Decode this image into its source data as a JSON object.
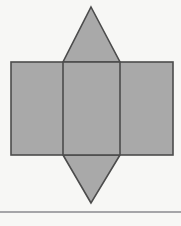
{
  "figure": {
    "title": "Geometric net diagram",
    "canvas": {
      "width": 181,
      "height": 226,
      "background_color": "#f7f7f5"
    },
    "style": {
      "fill_color": "#a9a9a9",
      "stroke_color": "#4c4c4c",
      "stroke_width": 1.6,
      "rule_color": "#8a8a8e"
    },
    "shapes": [
      {
        "id": "top-triangle",
        "name": "top-triangle",
        "type": "triangle",
        "points": "91,7 120,62 63,62",
        "vertices": [
          {
            "x": 91,
            "y": 7
          },
          {
            "x": 120,
            "y": 62
          },
          {
            "x": 63,
            "y": 62
          }
        ]
      },
      {
        "id": "bottom-triangle",
        "name": "bottom-triangle",
        "type": "triangle",
        "points": "91,203 63,155 120,155",
        "vertices": [
          {
            "x": 91,
            "y": 203
          },
          {
            "x": 63,
            "y": 155
          },
          {
            "x": 120,
            "y": 155
          }
        ]
      },
      {
        "id": "main-rectangle",
        "name": "main-rectangle",
        "type": "rect",
        "x": 11,
        "y": 62,
        "width": 162,
        "height": 93
      },
      {
        "id": "left-panel-divider",
        "name": "left-panel-divider",
        "type": "line",
        "x1": 63,
        "y1": 62,
        "x2": 63,
        "y2": 155
      },
      {
        "id": "right-panel-divider",
        "name": "right-panel-divider",
        "type": "line",
        "x1": 120,
        "y1": 62,
        "x2": 120,
        "y2": 155
      },
      {
        "id": "bottom-rule",
        "name": "bottom-horizontal-rule",
        "type": "line",
        "x1": 0,
        "y1": 212,
        "x2": 181,
        "y2": 212
      }
    ],
    "panels": [
      {
        "name": "left-panel",
        "x": 11,
        "y": 62,
        "width": 52,
        "height": 93
      },
      {
        "name": "middle-panel",
        "x": 63,
        "y": 62,
        "width": 57,
        "height": 93
      },
      {
        "name": "right-panel",
        "x": 120,
        "y": 62,
        "width": 53,
        "height": 93
      }
    ]
  }
}
